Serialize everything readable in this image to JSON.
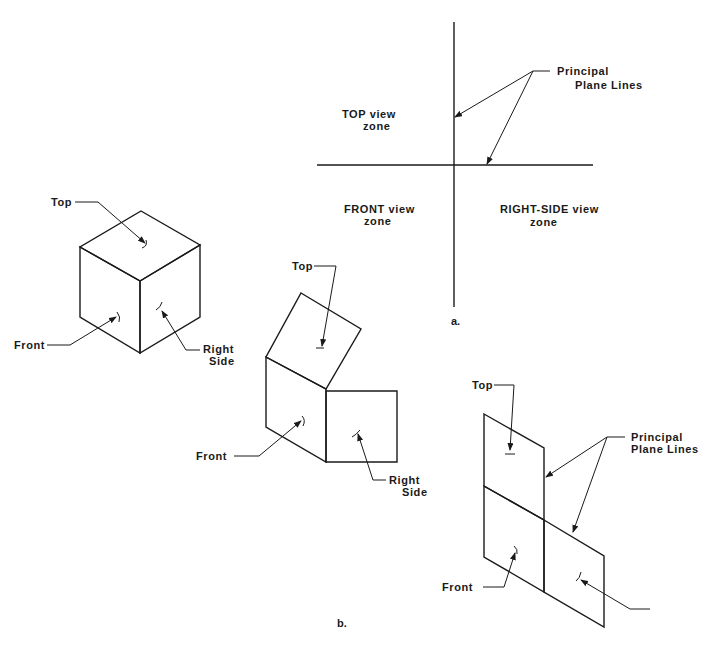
{
  "figure_a": {
    "caption": "a.",
    "callout": {
      "line1": "Principal",
      "line2": "Plane Lines"
    },
    "zones": {
      "top": {
        "line1": "TOP  view",
        "line2": "zone"
      },
      "front": {
        "line1": "FRONT  view",
        "line2": "zone"
      },
      "right_side": {
        "line1": "RIGHT-SIDE  view",
        "line2": "zone"
      }
    }
  },
  "figure_b": {
    "caption": "b.",
    "cube": {
      "top_label": "Top",
      "front_label": "Front",
      "right_label": {
        "line1": "Right",
        "line2": "Side"
      }
    },
    "unfolding": {
      "top_label": "Top",
      "front_label": "Front",
      "right_label": {
        "line1": "Right",
        "line2": "Side"
      }
    },
    "flattened": {
      "top_label": "Top",
      "front_label": "Front",
      "callout": {
        "line1": "Principal",
        "line2": "Plane Lines"
      }
    }
  },
  "colors": {
    "ink": "#1a1a1a",
    "paper": "#ffffff"
  }
}
